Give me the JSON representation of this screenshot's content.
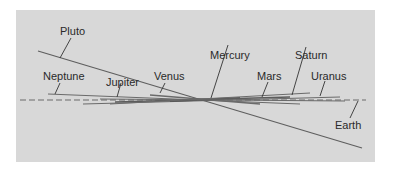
{
  "diagram": {
    "title": "",
    "colors": {
      "background": "#ffffff",
      "panel": "#d8d8d8",
      "line": "#5a5a5a",
      "text": "#2a2a2a"
    },
    "reference_plane": "Earth",
    "labels": {
      "pluto": "Pluto",
      "neptune": "Neptune",
      "jupiter": "Jupiter",
      "venus": "Venus",
      "mercury": "Mercury",
      "mars": "Mars",
      "saturn": "Saturn",
      "uranus": "Uranus",
      "earth": "Earth"
    }
  }
}
